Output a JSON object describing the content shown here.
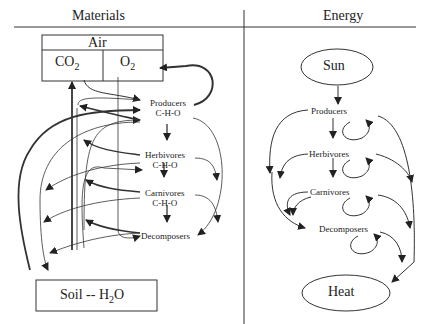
{
  "materials": {
    "header": "Materials",
    "air": {
      "label": "Air",
      "co2": "CO",
      "co2_sub": "2",
      "o2": "O",
      "o2_sub": "2"
    },
    "producers": {
      "name": "Producers",
      "formula": "C-H-O"
    },
    "herbivores": {
      "name": "Herbivores",
      "formula": "C-H-O"
    },
    "carnivores": {
      "name": "Carnivores",
      "formula": "C-H-O"
    },
    "decomposers": {
      "name": "Decomposers"
    },
    "soil": {
      "label_pre": "Soil -- H",
      "sub": "2",
      "label_post": "O"
    }
  },
  "energy": {
    "header": "Energy",
    "sun": "Sun",
    "producers": "Producers",
    "herbivores": "Herbivores",
    "carnivores": "Carnivores",
    "decomposers": "Decomposers",
    "heat": "Heat"
  }
}
